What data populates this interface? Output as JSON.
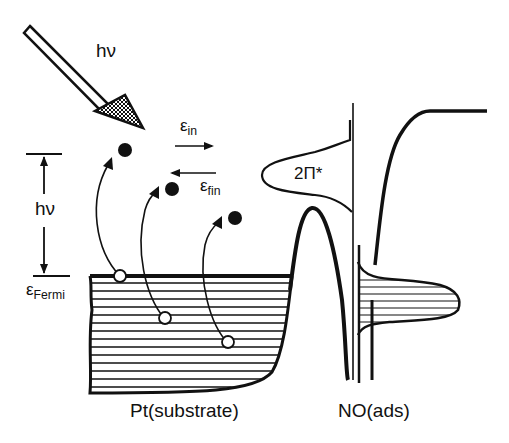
{
  "diagram": {
    "type": "energy-level schematic",
    "labels": {
      "photon": "hν",
      "photon_energy_gap": "hν",
      "epsilon_in_base": "ε",
      "epsilon_in_sub": "in",
      "epsilon_fin_base": "ε",
      "epsilon_fin_sub": "fin",
      "fermi_base": "ε",
      "fermi_sub": "Fermi",
      "orbital": "2Π*",
      "substrate": "Pt(substrate)",
      "adsorbate": "NO(ads)"
    },
    "elements": {
      "photon_arrow": "incoming photon arrow hv",
      "electron_excitations": 3,
      "holes": 3,
      "excited_electrons": 3,
      "arrows": [
        "ε_in (right)",
        "ε_fin (left)"
      ]
    },
    "colors": {
      "stroke": "#111111",
      "background": "#ffffff"
    }
  }
}
